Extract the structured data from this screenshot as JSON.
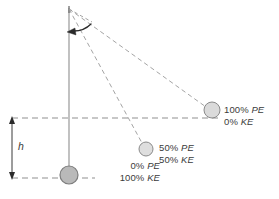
{
  "diagram": {
    "colors": {
      "rod": "#8a8a8a",
      "dashed": "#8f8f8f",
      "bob_fill_bottom": "#b8b8b8",
      "bob_fill_light": "#d8d8d8",
      "bob_stroke": "#8a8a8a",
      "arrow": "#2a2a2a",
      "text": "#3b3b3b"
    },
    "pivot": {
      "x": 69,
      "y": 8
    },
    "height_marker": {
      "label": "h",
      "x": 12,
      "top_y": 118,
      "bottom_y": 178
    },
    "reference_lines": [
      {
        "name": "upper-dashed-line",
        "y": 118,
        "x1": 12,
        "x2": 222
      },
      {
        "name": "lower-dashed-line",
        "y": 178,
        "x1": 12,
        "x2": 95
      }
    ],
    "bobs": [
      {
        "name": "bob-top-right",
        "x": 212,
        "y": 110,
        "r": 8,
        "state": "released",
        "pe": "100% PE",
        "ke": "0% KE"
      },
      {
        "name": "bob-middle",
        "x": 146,
        "y": 149,
        "r": 7,
        "state": "mid-swing",
        "pe": "50% PE",
        "ke": "50% KE"
      },
      {
        "name": "bob-bottom",
        "x": 69,
        "y": 175,
        "r": 9,
        "state": "lowest-point",
        "pe": "0% PE",
        "ke": "100% KE"
      }
    ],
    "labels": {
      "top_right": {
        "line1": "100% PE",
        "line2": "0% KE"
      },
      "middle": {
        "line1": "50% PE",
        "line2": "50% KE"
      },
      "bottom": {
        "line1": "0% PE",
        "line2": "100% KE"
      },
      "height": "h"
    }
  }
}
